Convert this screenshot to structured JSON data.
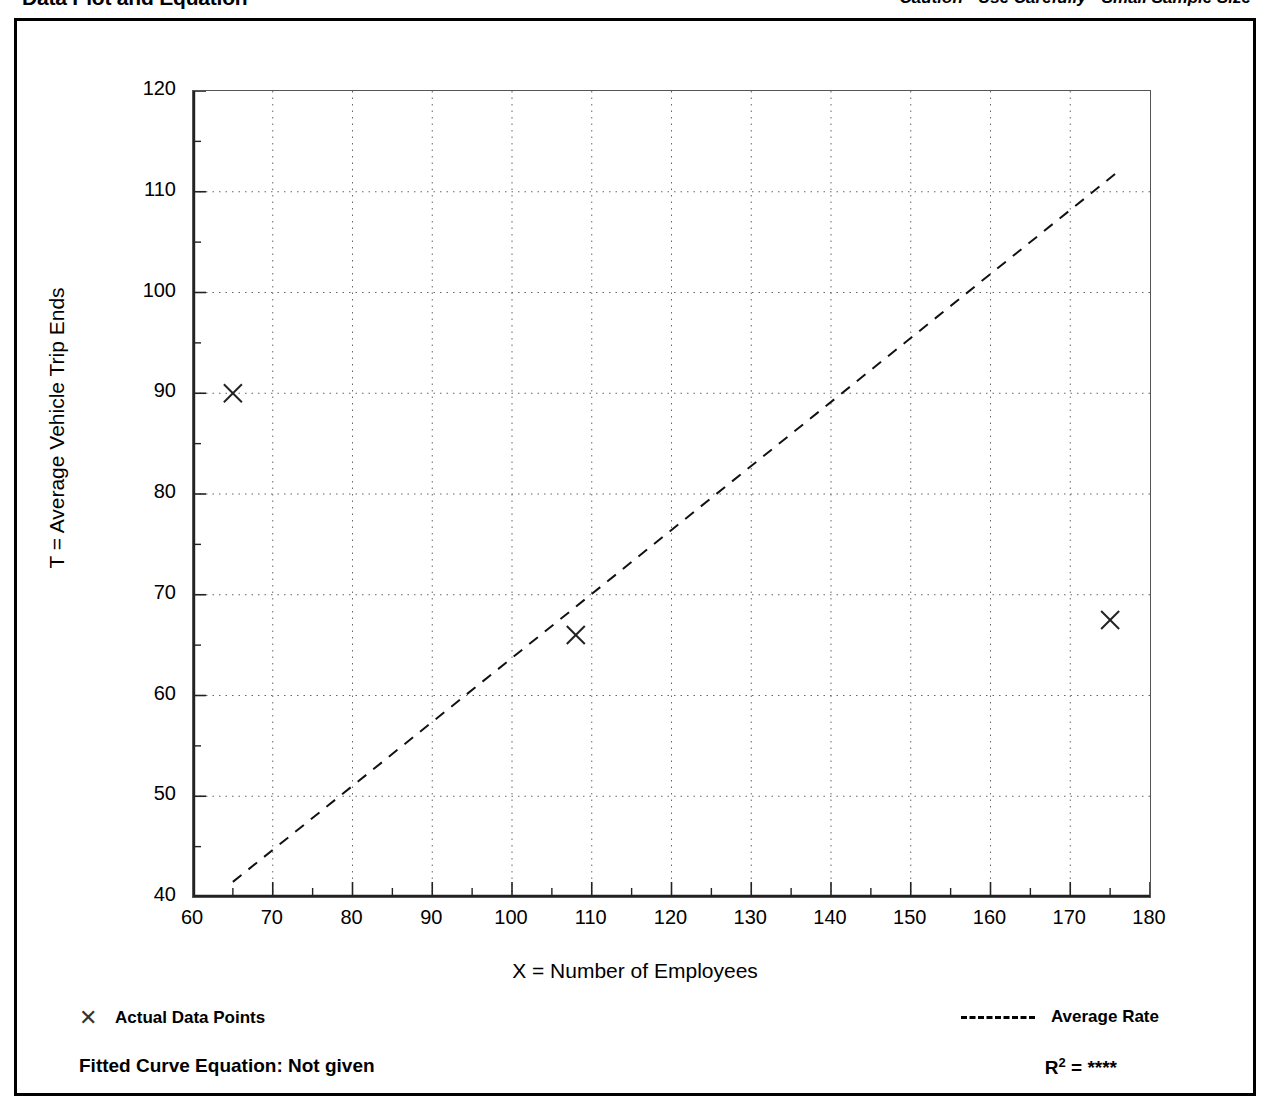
{
  "header": {
    "title": "Data Plot and Equation",
    "caution": "Caution - Use Carefully - Small Sample Size"
  },
  "legend": {
    "actual_label": "Actual Data Points",
    "actual_marker": "x-marker-icon",
    "average_label": "Average Rate",
    "average_marker": "dashed-line-icon"
  },
  "footer": {
    "equation_label": "Fitted Curve Equation:  Not given",
    "rsq_label": "R",
    "rsq_exponent": "2",
    "rsq_equals": " = ",
    "rsq_value": "****"
  },
  "chart_data": {
    "type": "scatter",
    "title": "Data Plot and Equation",
    "subtitle": "Caution - Use Carefully - Small Sample Size",
    "xlabel": "X = Number of Employees",
    "ylabel": "T = Average Vehicle Trip Ends",
    "xlim": [
      60,
      180
    ],
    "ylim": [
      40,
      120
    ],
    "x_major_ticks": [
      60,
      70,
      80,
      90,
      100,
      110,
      120,
      130,
      140,
      150,
      160,
      170,
      180
    ],
    "x_minor_ticks": [
      65,
      75,
      85,
      95,
      105,
      115,
      125,
      135,
      145,
      155,
      165,
      175
    ],
    "y_major_ticks": [
      40,
      50,
      60,
      70,
      80,
      90,
      100,
      110,
      120
    ],
    "y_minor_ticks": [
      45,
      55,
      65,
      75,
      85,
      95,
      105,
      115
    ],
    "grid": "dotted-major-both-axes",
    "legend_position": "below-plot",
    "series": [
      {
        "name": "Actual Data Points",
        "type": "scatter",
        "marker": "x",
        "points": [
          {
            "x": 65,
            "y": 90
          },
          {
            "x": 108,
            "y": 66
          },
          {
            "x": 175,
            "y": 67.5
          }
        ]
      },
      {
        "name": "Average Rate",
        "type": "line",
        "style": "dashed",
        "points": [
          {
            "x": 65,
            "y": 41.5
          },
          {
            "x": 176,
            "y": 112
          }
        ]
      }
    ]
  }
}
